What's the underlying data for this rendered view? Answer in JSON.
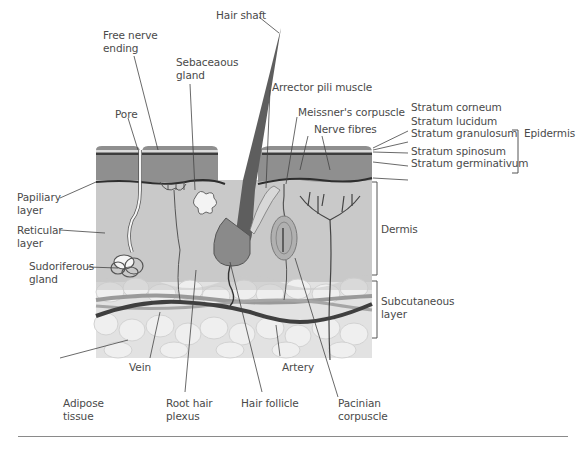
{
  "figure": {
    "labels": {
      "hair_shaft": "Hair shaft",
      "free_nerve_ending": [
        "Free nerve",
        "ending"
      ],
      "sebaceous_gland": [
        "Sebaceaous",
        "gland"
      ],
      "pore": "Pore",
      "arrector_pili_muscle": "Arrector pili muscle",
      "meissners_corpuscle": "Meissner's corpuscle",
      "nerve_fibres": "Nerve fibres",
      "stratum_corneum": "Stratum corneum",
      "stratum_lucidum": "Stratum lucidum",
      "stratum_granulosum": "Stratum granulosum",
      "stratum_spinosum": "Stratum spinosum",
      "stratum_germinativum": "Stratum germinativum",
      "epidermis": "Epidermis",
      "papillary_layer": [
        "Papiliary",
        "layer"
      ],
      "reticular_layer": [
        "Reticular",
        "layer"
      ],
      "sudoriferous_gland": [
        "Sudoriferous",
        "gland"
      ],
      "dermis": "Dermis",
      "subcutaneous_layer": [
        "Subcutaneous",
        "layer"
      ],
      "vein": "Vein",
      "artery": "Artery",
      "adipose_tissue": [
        "Adipose",
        "tissue"
      ],
      "root_hair_plexus": [
        "Root hair",
        "plexus"
      ],
      "hair_follicle": "Hair follicle",
      "pacinian_corpuscle": [
        "Pacinian",
        "corpuscle"
      ]
    },
    "colors": {
      "epidermis": "#8f8f8f",
      "dermis": "#c9c9c9",
      "adipose": "#e6e6e6",
      "vein": "#9a9a9a",
      "artery": "#3f3f3f",
      "hair": "#5e5e5e",
      "text": "#4a4a4a"
    }
  }
}
